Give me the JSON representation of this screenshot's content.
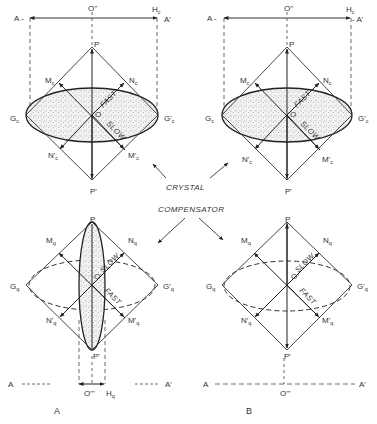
{
  "figure": {
    "panels": [
      {
        "id": "A",
        "label": "A",
        "crystal": {
          "axis_left": "A -",
          "axis_right": "A'",
          "center_top": "O''",
          "retardation_end": "H",
          "retardation_end_sub": "c",
          "top": "P",
          "bottom": "P'",
          "origin": "O",
          "left_corner": "G",
          "left_corner_sub": "c",
          "right_corner": "G'",
          "right_corner_sub": "c",
          "upper_left": "M",
          "upper_left_sub": "c",
          "upper_right": "N",
          "upper_right_sub": "c",
          "lower_left": "N'",
          "lower_left_sub": "c",
          "lower_right": "M'",
          "lower_right_sub": "c",
          "fast_label": "FAST",
          "slow_label": "SLOW"
        },
        "compensator": {
          "top": "P",
          "bottom": "P'",
          "origin": "O'",
          "left_corner": "G",
          "left_corner_sub": "q",
          "right_corner": "G'",
          "right_corner_sub": "q",
          "upper_left": "M",
          "upper_left_sub": "q",
          "upper_right": "N",
          "upper_right_sub": "q",
          "lower_left": "N'",
          "lower_left_sub": "q",
          "lower_right": "M'",
          "lower_right_sub": "q",
          "fast_label": "FAST",
          "slow_label": "SLOW",
          "axis_left": "A",
          "axis_right": "A'",
          "center_bottom": "O'''",
          "retardation_end": "H",
          "retardation_end_sub": "q"
        }
      },
      {
        "id": "B",
        "label": "B",
        "crystal": {
          "axis_left": "A -",
          "axis_right": "- A'",
          "center_top": "O''",
          "retardation_end": "H",
          "retardation_end_sub": "c",
          "top": "P",
          "bottom": "P'",
          "origin": "O",
          "left_corner": "G",
          "left_corner_sub": "c",
          "right_corner": "G'",
          "right_corner_sub": "c",
          "upper_left": "M",
          "upper_left_sub": "c",
          "upper_right": "N",
          "upper_right_sub": "c",
          "lower_left": "N'",
          "lower_left_sub": "c",
          "lower_right": "M'",
          "lower_right_sub": "c",
          "fast_label": "FAST",
          "slow_label": "SLOW"
        },
        "compensator": {
          "top": "P",
          "bottom": "P'",
          "origin": "O'",
          "left_corner": "G",
          "left_corner_sub": "q",
          "right_corner": "G'",
          "right_corner_sub": "q",
          "upper_left": "M",
          "upper_left_sub": "q",
          "upper_right": "N",
          "upper_right_sub": "q",
          "lower_left": "N'",
          "lower_left_sub": "q",
          "lower_right": "M'",
          "lower_right_sub": "q",
          "fast_label": "FAST",
          "slow_label": "SLOW",
          "axis_left": "A",
          "axis_right": "A'",
          "center_bottom": "O'''"
        }
      }
    ],
    "center_labels": {
      "crystal": "CRYSTAL",
      "compensator": "COMPENSATOR"
    }
  }
}
